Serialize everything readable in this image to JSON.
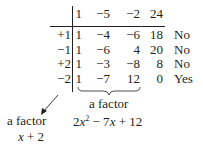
{
  "divisors_header": "",
  "coefficients": [
    "1",
    "−5",
    "−2",
    "24"
  ],
  "rows": [
    {
      "divisor": "+1",
      "values": [
        "1",
        "−4",
        "−6",
        "18"
      ],
      "result": "No"
    },
    {
      "divisor": "−1",
      "values": [
        "1",
        "−6",
        "4",
        "20"
      ],
      "result": "No"
    },
    {
      "divisor": "+2",
      "values": [
        "1",
        "−3",
        "−8",
        "8"
      ],
      "result": "No"
    },
    {
      "divisor": "−2",
      "values": [
        "1",
        "−7",
        "12",
        "0"
      ],
      "result": "Yes"
    }
  ],
  "annotations": {
    "quotient_label": "a factor",
    "quotient_expr_pre": "2",
    "quotient_expr_x1": "x",
    "quotient_expr_exp": "2",
    "quotient_expr_mid": " − 7",
    "quotient_expr_x2": "x",
    "quotient_expr_post": " + 12",
    "divisor_label": "a factor",
    "divisor_expr_x": "x",
    "divisor_expr_rest": " + 2"
  },
  "colors": {
    "ink": "#231f20",
    "background": "#ffffff"
  }
}
